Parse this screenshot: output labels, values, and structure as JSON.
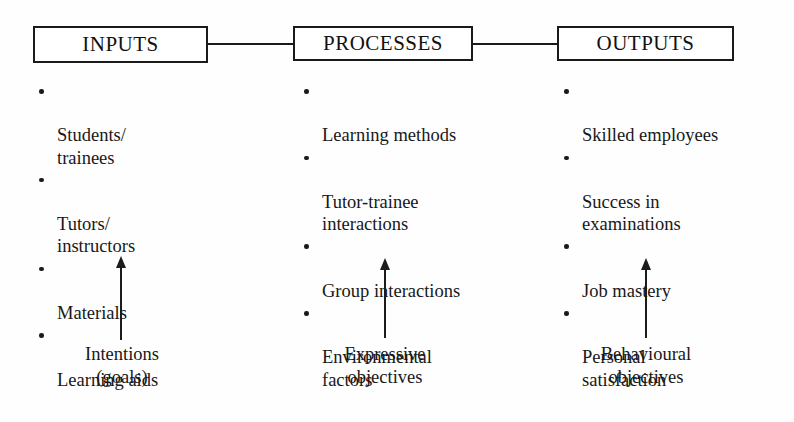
{
  "diagram": {
    "colors": {
      "background": "#fefefe",
      "ink": "#1a1a1a",
      "box_fill": "#ffffff"
    },
    "stages": [
      {
        "id": "inputs",
        "box_label": "INPUTS",
        "items": [
          "Students/\ntrainees",
          "Tutors/\ninstructors",
          "Materials",
          "Learning aids"
        ],
        "caption": "Intentions\n(goals)"
      },
      {
        "id": "processes",
        "box_label": "PROCESSES",
        "items": [
          "Learning methods",
          "Tutor-trainee\ninteractions",
          "Group interactions",
          "Environmental\nfactors"
        ],
        "caption": "Expressive\nobjectives"
      },
      {
        "id": "outputs",
        "box_label": "OUTPUTS",
        "items": [
          "Skilled employees",
          "Success in\nexaminations",
          "Job mastery",
          "Personal\nsatisfaction"
        ],
        "caption": "Behavioural\nobjectives"
      }
    ],
    "connectors": [
      {
        "from": "inputs",
        "to": "processes",
        "style": "plain-line"
      },
      {
        "from": "processes",
        "to": "outputs",
        "style": "plain-line"
      }
    ],
    "arrows": [
      {
        "target": "inputs",
        "direction": "up",
        "icon": "up-arrow-icon"
      },
      {
        "target": "processes",
        "direction": "up",
        "icon": "up-arrow-icon"
      },
      {
        "target": "outputs",
        "direction": "up",
        "icon": "up-arrow-icon"
      }
    ]
  }
}
